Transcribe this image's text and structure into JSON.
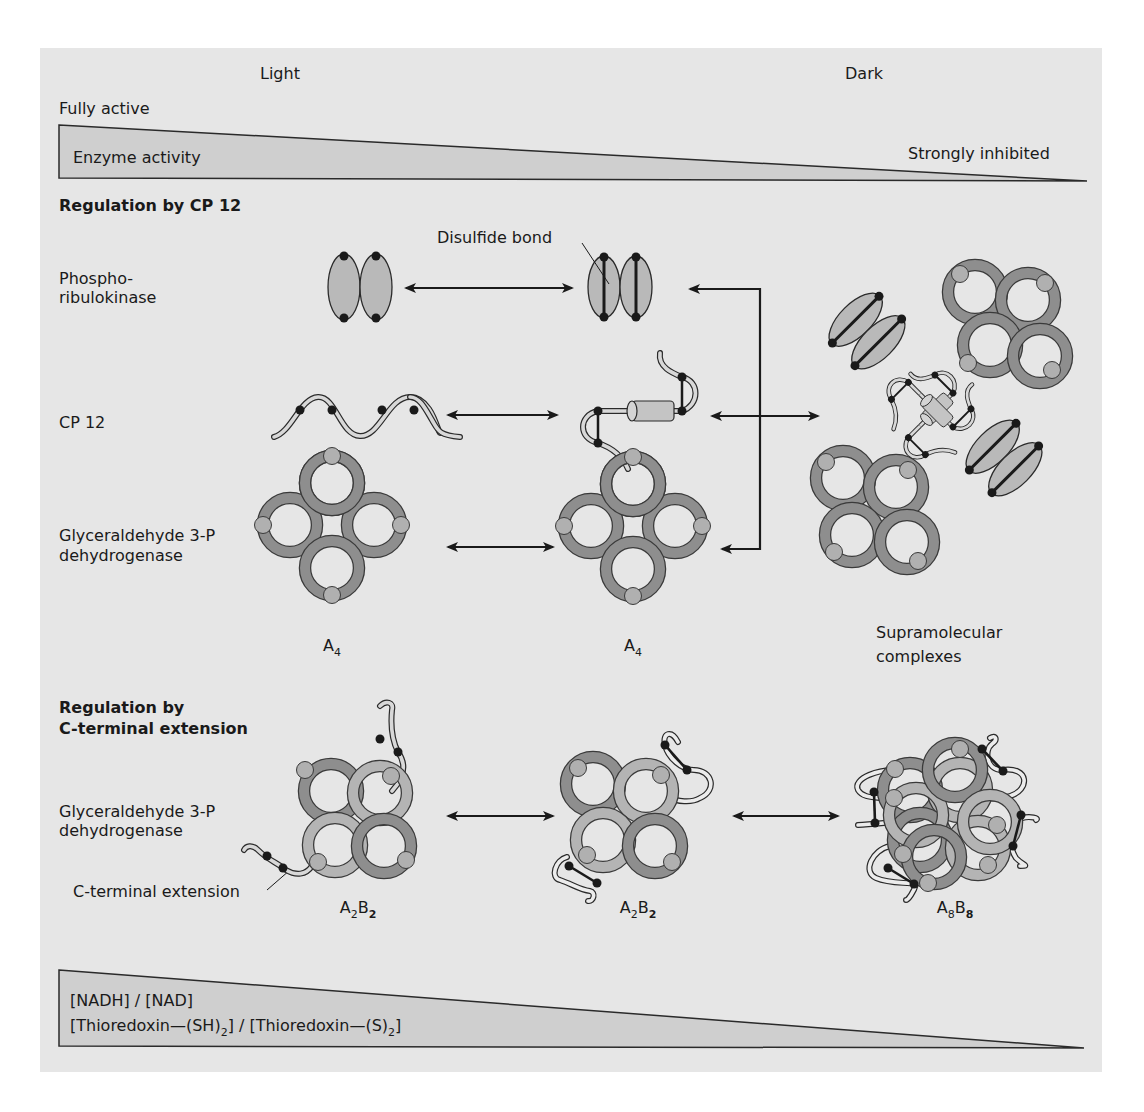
{
  "header": {
    "light_label": "Light",
    "dark_label": "Dark",
    "fully_active": "Fully active",
    "strongly_inhibited": "Strongly inhibited"
  },
  "activity_wedge": {
    "label": "Enzyme activity"
  },
  "section_cp12": {
    "title": "Regulation by CP 12",
    "rows": [
      {
        "label_line1": "Phospho-",
        "label_line2": "ribulokinase"
      },
      {
        "label_line1": "CP 12"
      },
      {
        "label_line1": "Glyceraldehyde 3-P",
        "label_line2": "dehydrogenase"
      }
    ],
    "disulfide_label": "Disulfide bond",
    "state_labels": [
      {
        "base": "A",
        "sub": "4"
      },
      {
        "base": "A",
        "sub": "4"
      }
    ],
    "complex_label_line1": "Supramolecular",
    "complex_label_line2": "complexes"
  },
  "section_cterm": {
    "title_line1": "Regulation by",
    "title_line2": "C-terminal extension",
    "row_label_line1": "Glyceraldehyde 3-P",
    "row_label_line2": "dehydrogenase",
    "extension_label": "C-terminal extension",
    "state_labels": [
      {
        "a": "A",
        "a_sub": "2",
        "b": "B",
        "b_sub": "2"
      },
      {
        "a": "A",
        "a_sub": "2",
        "b": "B",
        "b_sub": "2"
      },
      {
        "a": "A",
        "a_sub": "8",
        "b": "B",
        "b_sub": "8"
      }
    ]
  },
  "redox_wedge": {
    "line1": "[NADH] / [NAD]",
    "line2_part1": "[Thioredoxin—(SH)",
    "line2_sub1": "2",
    "line2_part2": "] / [Thioredoxin—(S)",
    "line2_sub2": "2",
    "line2_part3": "]"
  },
  "colors": {
    "panel_bg": "#e6e6e6",
    "wedge_fill": "#c8c8c8",
    "ring_dark": "#8e8e8e",
    "ring_light": "#b4b4b4",
    "protein_fill": "#b9b9b9",
    "knob_fill": "#b0b0b0",
    "ink": "#1a1a1a"
  }
}
